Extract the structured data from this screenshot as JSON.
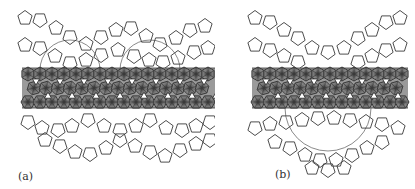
{
  "figure": {
    "panels": [
      {
        "id": "a",
        "label": "(a)",
        "description": "Pentagonal tiling above and below a dense band of hatched polyhedra (wide wavy layer)"
      },
      {
        "id": "b",
        "label": "(b)",
        "description": "Pentagonal tiling bowl-shaped above and below a dense band of hatched polyhedra (narrower layer)"
      }
    ],
    "colors": {
      "line": "#3a3a3a",
      "band_fill": "#2a2a2a",
      "background": "#ffffff"
    }
  }
}
